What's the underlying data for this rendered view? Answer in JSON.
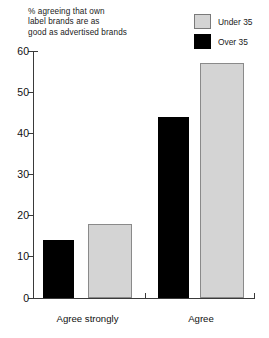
{
  "chart_data": {
    "type": "bar",
    "title": "% agreeing that own label brands are as good as advertised brands",
    "title_lines": [
      "% agreeing that own",
      "label brands are as",
      "good as advertised brands"
    ],
    "xlabel": "",
    "ylabel": "",
    "ylim": [
      0,
      60
    ],
    "yticks": [
      0,
      10,
      20,
      30,
      40,
      50,
      60
    ],
    "ytick_labels": [
      "0",
      "10",
      "20",
      "30",
      "40",
      "50",
      "60"
    ],
    "grid": false,
    "legend_position": "top-right",
    "categories": [
      "Agree strongly",
      "Agree"
    ],
    "series": [
      {
        "name": "Over 35",
        "color": "#000000",
        "values": [
          14,
          44
        ]
      },
      {
        "name": "Under 35",
        "color": "#d4d4d4",
        "values": [
          18,
          57
        ]
      }
    ],
    "legend": [
      {
        "label": "Under 35",
        "color": "#d4d4d4"
      },
      {
        "label": "Over 35",
        "color": "#000000"
      }
    ]
  }
}
